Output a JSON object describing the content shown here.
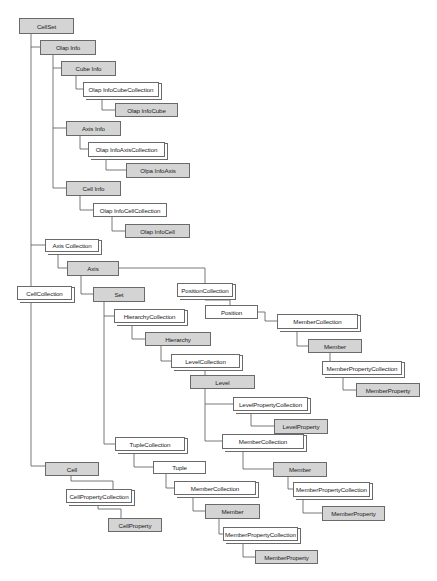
{
  "diagram": {
    "colors": {
      "object_fill": "#d4d4d4",
      "collection_fill": "#ffffff",
      "border": "#6a6a6a",
      "line": "#555555"
    },
    "nodes": {
      "cellset": "CellSet",
      "olap_info": "Olap Info",
      "cube_info": "Cube Info",
      "olap_info_cube_collection": "Olap InfoCubeCollection",
      "olap_info_cube": "Olap InfoCube",
      "axis_info": "Axis  Info",
      "olap_info_axis_collection": "Olap InfoAxisCollection",
      "olpa_info_axis": "Olpa InfoAxis",
      "cell_info": "Cell Info",
      "olap_info_cell_collection": "Olap InfoCellCollection",
      "olap_info_cell": "Olap InfoCell",
      "axis_collection": "Axis Collection",
      "axis": "Axis",
      "cell_collection": "CellCollection",
      "set": "Set",
      "position_collection": "PositionCollection",
      "position": "Position",
      "member_collection_pos": "MemberCollection",
      "member_pos": "Member",
      "member_property_collection_pos": "MemberPropertyCollection",
      "member_property_pos": "MemberProperty",
      "hierarchy_collection": "HierarchyCollection",
      "hierarchy": "Hierarchy",
      "level_collection": "LevelCollection",
      "level": "Level",
      "level_property_collection": "LevelPropertyCollection",
      "level_property": "LevelProperty",
      "member_collection_level": "MemberCollection",
      "member_level": "Member",
      "member_property_collection_level": "MemberPropertyCollection",
      "member_property_level": "MemberProperty",
      "tuple_collection": "TupleCollection",
      "tuple": "Tuple",
      "member_collection_tuple": "MemberCollection",
      "member_tuple": "Member",
      "member_property_collection_tuple": "MemberPropertyCollection",
      "member_property_tuple": "MemberProperty",
      "cell": "Cell",
      "cell_property_collection": "CellPropertyCollection",
      "cell_property": "CellProperty"
    },
    "edges": [
      [
        "cellset",
        "olap_info"
      ],
      [
        "olap_info",
        "cube_info"
      ],
      [
        "cube_info",
        "olap_info_cube_collection"
      ],
      [
        "olap_info_cube_collection",
        "olap_info_cube"
      ],
      [
        "olap_info",
        "axis_info"
      ],
      [
        "axis_info",
        "olap_info_axis_collection"
      ],
      [
        "olap_info_axis_collection",
        "olpa_info_axis"
      ],
      [
        "olap_info",
        "cell_info"
      ],
      [
        "cell_info",
        "olap_info_cell_collection"
      ],
      [
        "olap_info_cell_collection",
        "olap_info_cell"
      ],
      [
        "cellset",
        "axis_collection"
      ],
      [
        "axis_collection",
        "axis"
      ],
      [
        "axis",
        "set"
      ],
      [
        "axis",
        "position_collection"
      ],
      [
        "position_collection",
        "position"
      ],
      [
        "position",
        "member_collection_pos"
      ],
      [
        "member_collection_pos",
        "member_pos"
      ],
      [
        "member_pos",
        "member_property_collection_pos"
      ],
      [
        "member_property_collection_pos",
        "member_property_pos"
      ],
      [
        "set",
        "hierarchy_collection"
      ],
      [
        "hierarchy_collection",
        "hierarchy"
      ],
      [
        "hierarchy",
        "level_collection"
      ],
      [
        "level_collection",
        "level"
      ],
      [
        "level",
        "level_property_collection"
      ],
      [
        "level_property_collection",
        "level_property"
      ],
      [
        "level",
        "member_collection_level"
      ],
      [
        "member_collection_level",
        "member_level"
      ],
      [
        "member_level",
        "member_property_collection_level"
      ],
      [
        "member_property_collection_level",
        "member_property_level"
      ],
      [
        "set",
        "tuple_collection"
      ],
      [
        "tuple_collection",
        "tuple"
      ],
      [
        "tuple",
        "member_collection_tuple"
      ],
      [
        "member_collection_tuple",
        "member_tuple"
      ],
      [
        "member_tuple",
        "member_property_collection_tuple"
      ],
      [
        "member_property_collection_tuple",
        "member_property_tuple"
      ],
      [
        "cellset",
        "cell_collection"
      ],
      [
        "cell_collection",
        "cell"
      ],
      [
        "cell",
        "cell_property_collection"
      ],
      [
        "cell_property_collection",
        "cell_property"
      ]
    ]
  }
}
